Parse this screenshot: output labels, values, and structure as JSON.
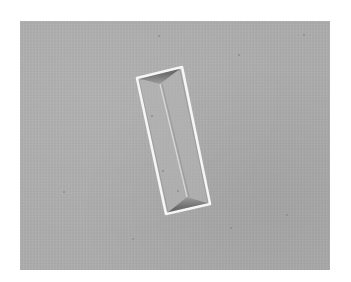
{
  "image": {
    "kind": "grayscale photomicrograph",
    "subject": "single rectangular prismatic crystal",
    "background_color": "#acacac",
    "border_color": "#ffffff",
    "crystal": {
      "edge_color": "#f4f4f4",
      "shadow_color": "#5a5a5a",
      "corners": {
        "top_left": [
          137,
          78
        ],
        "top_right": [
          182,
          67
        ],
        "bottom_right": [
          210,
          204
        ],
        "bottom_left": [
          166,
          214
        ]
      }
    }
  }
}
